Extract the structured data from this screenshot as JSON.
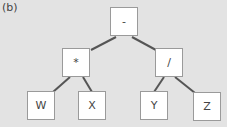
{
  "figure_label": "(b)",
  "tree": {
    "root": {
      "label": "-"
    },
    "left": {
      "label": "*"
    },
    "right": {
      "label": "/"
    },
    "left_left": {
      "label": "W"
    },
    "left_right": {
      "label": "X"
    },
    "right_left": {
      "label": "Y"
    },
    "right_right": {
      "label": "Z"
    }
  },
  "colors": {
    "background": "#e3e3e3",
    "node_fill": "#ffffff",
    "edge": "#555555"
  }
}
